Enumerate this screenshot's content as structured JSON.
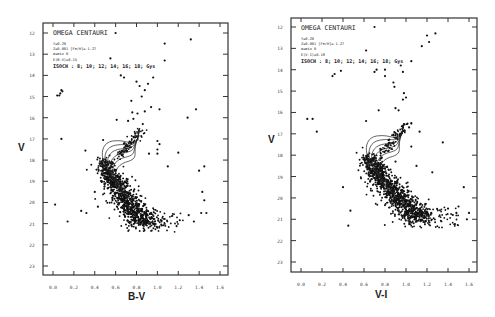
{
  "chart_data": [
    {
      "type": "scatter",
      "panel": "left",
      "title": "OMEGA CENTAURI",
      "annotations": [
        "Y=0.20",
        "Z=0.001 [Fe/H]=-1.27",
        "α=mix 0",
        "E(B-V)=0.15",
        "ISOCH :  8; 10; 12; 14; 16; 18;  Gys"
      ],
      "xlabel": "B-V",
      "ylabel": "V",
      "xlim": [
        -0.08,
        1.68
      ],
      "ylim": [
        23.4,
        11.6
      ],
      "x_ticks": [
        "0.0",
        "0.2",
        "0.4",
        "0.6",
        "0.8",
        "1.0",
        "1.2",
        "1.4",
        "1.6"
      ],
      "y_ticks": [
        "12",
        "13",
        "14",
        "15",
        "16",
        "17",
        "18",
        "19",
        "20",
        "21",
        "22",
        "23"
      ],
      "isochrone_ages_gyr": [
        8,
        10,
        12,
        14,
        16,
        18
      ],
      "main_sequence": {
        "turnoff_x": 0.5,
        "turnoff_y": 18.0,
        "bottom_x": 0.9,
        "bottom_y": 21.1,
        "n_points": 900,
        "width": 0.055
      },
      "outliers": [
        [
          0.6,
          12.0
        ],
        [
          0.55,
          13.2
        ],
        [
          1.07,
          13.3
        ],
        [
          1.07,
          12.5
        ],
        [
          1.32,
          12.3
        ],
        [
          0.65,
          14.0
        ],
        [
          0.68,
          14.1
        ],
        [
          0.8,
          14.3
        ],
        [
          0.91,
          14.4
        ],
        [
          0.83,
          14.5
        ],
        [
          0.88,
          14.7
        ],
        [
          0.96,
          14.1
        ],
        [
          0.04,
          14.95
        ],
        [
          0.07,
          14.85
        ],
        [
          0.08,
          14.7
        ],
        [
          0.09,
          14.75
        ],
        [
          0.06,
          14.95
        ],
        [
          0.75,
          15.2
        ],
        [
          0.85,
          15.0
        ],
        [
          0.94,
          15.5
        ],
        [
          1.02,
          15.6
        ],
        [
          0.76,
          15.75
        ],
        [
          0.81,
          15.8
        ],
        [
          0.88,
          15.7
        ],
        [
          0.61,
          16.1
        ],
        [
          0.72,
          16.15
        ],
        [
          0.86,
          16.3
        ],
        [
          0.77,
          16.05
        ],
        [
          1.29,
          16.0
        ],
        [
          1.37,
          15.6
        ],
        [
          0.08,
          17.0
        ],
        [
          0.48,
          17.05
        ],
        [
          1.0,
          17.1
        ],
        [
          1.02,
          17.25
        ],
        [
          1.0,
          17.5
        ],
        [
          0.31,
          17.55
        ],
        [
          0.92,
          17.7
        ],
        [
          1.0,
          17.7
        ],
        [
          1.2,
          17.65
        ],
        [
          0.5,
          18.6
        ],
        [
          1.1,
          18.3
        ],
        [
          1.4,
          18.5
        ],
        [
          1.45,
          18.3
        ],
        [
          1.43,
          19.5
        ],
        [
          1.45,
          19.9
        ],
        [
          1.3,
          20.6
        ],
        [
          1.42,
          20.5
        ],
        [
          0.27,
          20.4
        ],
        [
          0.32,
          20.5
        ],
        [
          0.14,
          20.9
        ],
        [
          1.47,
          20.5
        ],
        [
          1.35,
          20.9
        ],
        [
          0.4,
          19.5
        ],
        [
          0.43,
          20.2
        ],
        [
          0.02,
          20.1
        ]
      ]
    },
    {
      "type": "scatter",
      "panel": "right",
      "title": "OMEGA CENTAURI",
      "annotations": [
        "Y=0.20",
        "Z=0.001 [Fe/H]=-1.27",
        "α=mix 0",
        "E(V-I)=0.18",
        "ISOCH :  8; 10; 12; 14; 16; 18;  Gys"
      ],
      "xlabel": "V-I",
      "ylabel": "V",
      "xlim": [
        -0.08,
        1.68
      ],
      "ylim": [
        23.4,
        11.6
      ],
      "x_ticks": [
        "0.0",
        "0.2",
        "0.4",
        "0.6",
        "0.8",
        "1.0",
        "1.2",
        "1.4",
        "1.6"
      ],
      "y_ticks": [
        "12",
        "13",
        "14",
        "15",
        "16",
        "17",
        "18",
        "19",
        "20",
        "21",
        "22",
        "23"
      ],
      "isochrone_ages_gyr": [
        8,
        10,
        12,
        14,
        16,
        18
      ],
      "main_sequence": {
        "turnoff_x": 0.65,
        "turnoff_y": 18.0,
        "bottom_x": 1.15,
        "bottom_y": 21.1,
        "n_points": 1000,
        "width": 0.06
      },
      "outliers": [
        [
          0.7,
          12.0
        ],
        [
          0.62,
          13.1
        ],
        [
          1.2,
          12.4
        ],
        [
          1.22,
          12.7
        ],
        [
          1.15,
          12.9
        ],
        [
          1.28,
          12.3
        ],
        [
          0.3,
          14.3
        ],
        [
          0.32,
          14.2
        ],
        [
          0.38,
          14.05
        ],
        [
          0.7,
          14.1
        ],
        [
          0.72,
          14.0
        ],
        [
          0.8,
          14.0
        ],
        [
          0.95,
          13.8
        ],
        [
          0.97,
          14.1
        ],
        [
          1.05,
          13.6
        ],
        [
          0.8,
          14.3
        ],
        [
          0.88,
          14.6
        ],
        [
          0.89,
          14.8
        ],
        [
          0.98,
          15.1
        ],
        [
          1.0,
          15.3
        ],
        [
          0.97,
          15.4
        ],
        [
          0.74,
          15.9
        ],
        [
          0.9,
          15.8
        ],
        [
          0.93,
          15.9
        ],
        [
          1.03,
          16.7
        ],
        [
          1.05,
          16.5
        ],
        [
          1.13,
          16.9
        ],
        [
          1.35,
          17.4
        ],
        [
          0.62,
          16.4
        ],
        [
          0.06,
          16.3
        ],
        [
          0.11,
          16.3
        ],
        [
          0.15,
          16.9
        ],
        [
          0.88,
          17.4
        ],
        [
          1.05,
          17.6
        ],
        [
          0.9,
          18.3
        ],
        [
          1.1,
          18.5
        ],
        [
          1.25,
          18.8
        ],
        [
          1.55,
          19.5
        ],
        [
          1.5,
          20.4
        ],
        [
          1.48,
          20.7
        ],
        [
          1.4,
          20.5
        ],
        [
          1.58,
          21.0
        ],
        [
          1.6,
          20.7
        ],
        [
          0.47,
          20.6
        ],
        [
          0.45,
          21.3
        ],
        [
          0.4,
          19.5
        ]
      ]
    }
  ]
}
